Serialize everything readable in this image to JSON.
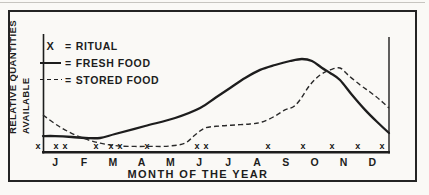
{
  "figure": {
    "y_axis_label_line1": "RELATIVE QUANTITIES",
    "y_axis_label_line2": "AVAILABLE",
    "ink_color": "#1d1d1d",
    "paper_color": "#faf9f6",
    "legend": [
      {
        "symbol": "X",
        "eq": "=",
        "label": "RITUAL"
      },
      {
        "symbol": "solid-line",
        "eq": "=",
        "label": "FRESH FOOD"
      },
      {
        "symbol": "dashed-line",
        "eq": "=",
        "label": "STORED FOOD"
      }
    ]
  },
  "chart_data": {
    "type": "line",
    "title": "",
    "xlabel": "MONTH OF THE YEAR",
    "ylabel": "RELATIVE QUANTITIES AVAILABLE",
    "categories": [
      "J",
      "F",
      "M",
      "A",
      "M",
      "J",
      "J",
      "A",
      "S",
      "O",
      "N",
      "D"
    ],
    "xlim": [
      0,
      12
    ],
    "ylim": [
      0,
      1
    ],
    "grid": false,
    "legend_position": "top-left",
    "y_note": "axis unlabeled; values are relative quantities estimated 0-1",
    "series": [
      {
        "name": "FRESH FOOD",
        "style": "solid",
        "points": [
          [
            0,
            0.15
          ],
          [
            0.42,
            0.15
          ],
          [
            1.0,
            0.142
          ],
          [
            1.46,
            0.133
          ],
          [
            1.98,
            0.133
          ],
          [
            2.5,
            0.168
          ],
          [
            3.54,
            0.239
          ],
          [
            4.58,
            0.31
          ],
          [
            5.45,
            0.398
          ],
          [
            5.97,
            0.487
          ],
          [
            6.49,
            0.575
          ],
          [
            7.01,
            0.664
          ],
          [
            7.53,
            0.735
          ],
          [
            8.05,
            0.779
          ],
          [
            8.57,
            0.814
          ],
          [
            8.98,
            0.832
          ],
          [
            9.33,
            0.814
          ],
          [
            9.68,
            0.752
          ],
          [
            9.96,
            0.708
          ],
          [
            10.3,
            0.646
          ],
          [
            10.72,
            0.513
          ],
          [
            11.17,
            0.381
          ],
          [
            11.59,
            0.274
          ],
          [
            12,
            0.177
          ]
        ]
      },
      {
        "name": "STORED FOOD",
        "style": "dashed",
        "points": [
          [
            0,
            0.336
          ],
          [
            0.59,
            0.23
          ],
          [
            1.28,
            0.142
          ],
          [
            1.98,
            0.088
          ],
          [
            2.67,
            0.062
          ],
          [
            3.71,
            0.058
          ],
          [
            4.4,
            0.062
          ],
          [
            4.93,
            0.088
          ],
          [
            5.27,
            0.159
          ],
          [
            5.62,
            0.221
          ],
          [
            6.14,
            0.239
          ],
          [
            6.66,
            0.248
          ],
          [
            7.18,
            0.257
          ],
          [
            7.6,
            0.274
          ],
          [
            8.05,
            0.327
          ],
          [
            8.39,
            0.381
          ],
          [
            8.67,
            0.407
          ],
          [
            8.91,
            0.469
          ],
          [
            9.26,
            0.602
          ],
          [
            9.61,
            0.69
          ],
          [
            9.96,
            0.735
          ],
          [
            10.3,
            0.752
          ],
          [
            10.58,
            0.69
          ],
          [
            11.0,
            0.602
          ],
          [
            11.34,
            0.54
          ],
          [
            11.69,
            0.469
          ],
          [
            12,
            0.398
          ]
        ]
      },
      {
        "name": "RITUAL",
        "style": "x-marks",
        "marker_glyph": "x",
        "positions": [
          -0.17,
          0.45,
          0.76,
          1.84,
          2.36,
          2.67,
          3.61,
          5.34,
          5.65,
          7.8,
          9.02,
          10.02,
          10.92,
          11.76
        ]
      }
    ]
  }
}
